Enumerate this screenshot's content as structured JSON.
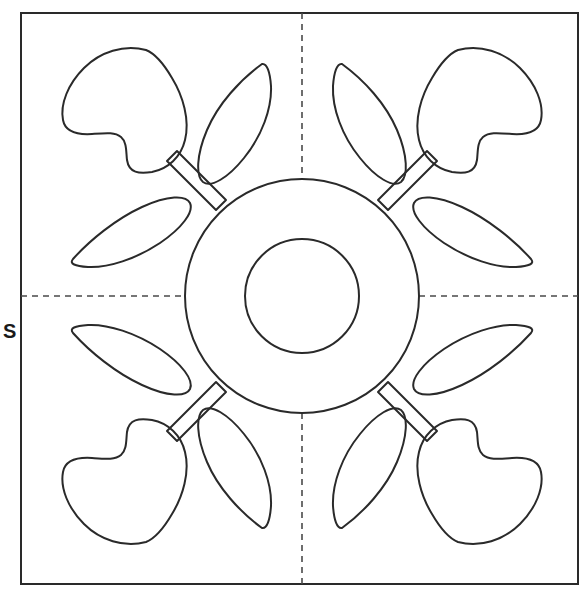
{
  "figure": {
    "kind": "line-art-diagram",
    "canvas": {
      "width": 584,
      "height": 593
    },
    "colors": {
      "background": "#ffffff",
      "stroke": "#2a2a2a",
      "dashed_guide": "#4a4a4a",
      "label_text": "#1a1a1a",
      "fill": "none"
    },
    "labels": {
      "left_axis": "S"
    },
    "frame": {
      "name": "outer-border",
      "x": 21,
      "y": 13,
      "width": 557,
      "height": 571,
      "stroke_width": 2
    },
    "guides": {
      "name": "symmetry-axes",
      "style": "dashed",
      "dash_pattern": "6 5",
      "vertical_x": 302,
      "horizontal_y": 296,
      "segments": [
        {
          "name": "guide-top",
          "x1": 302,
          "y1": 13,
          "x2": 302,
          "y2": 179
        },
        {
          "name": "guide-bottom",
          "x1": 302,
          "y1": 413,
          "x2": 302,
          "y2": 584
        },
        {
          "name": "guide-left",
          "x1": 21,
          "y1": 296,
          "x2": 186,
          "y2": 296
        },
        {
          "name": "guide-right",
          "x1": 419,
          "y1": 296,
          "x2": 578,
          "y2": 296
        }
      ]
    },
    "center_medallion": {
      "name": "center-rosette",
      "cx": 302,
      "cy": 296,
      "outer_radius": 117,
      "inner_radius": 57,
      "stroke_width": 2
    },
    "motif_units": [
      {
        "name": "motif-top-left",
        "quadrant": "top-left",
        "flip_x": false,
        "flip_y": false
      },
      {
        "name": "motif-top-right",
        "quadrant": "top-right",
        "flip_x": true,
        "flip_y": false
      },
      {
        "name": "motif-bottom-left",
        "quadrant": "bottom-left",
        "flip_x": false,
        "flip_y": true
      },
      {
        "name": "motif-bottom-right",
        "quadrant": "bottom-right",
        "flip_x": true,
        "flip_y": true
      }
    ],
    "motif_parts": [
      {
        "name": "tulip-bell-flower",
        "count_total": 4,
        "description": "bell / tulip shaped blossom with two side notches"
      },
      {
        "name": "outer-leaf",
        "count_total": 4,
        "description": "pointed oval leaf placed above the stem"
      },
      {
        "name": "inner-leaf",
        "count_total": 4,
        "description": "pointed oval leaf placed below the stem"
      },
      {
        "name": "stem-band",
        "count_total": 4,
        "description": "narrow diagonal band joining blossom to the central rosette"
      }
    ],
    "counts": {
      "flowers": 4,
      "leaves": 8,
      "stems": 4,
      "circles": 2,
      "dashed_guides": 2
    }
  }
}
